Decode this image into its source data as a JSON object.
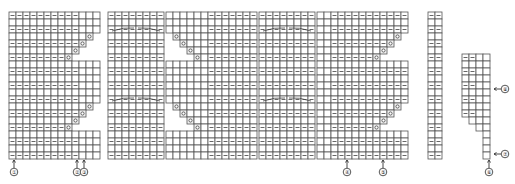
{
  "diagram": {
    "type": "knitting-chart",
    "cell_size": 7,
    "origin_y": 12,
    "colors": {
      "grid": "#555555",
      "background": "#ffffff",
      "yarn_over_box": "#f2f2f2"
    },
    "legend_symbols": {
      "blank": "knit",
      "dash": "purl",
      "circle": "yarn-over",
      "cable": "cable-cross"
    },
    "blocks": [
      {
        "id": "panel-1",
        "x": 9,
        "cols": 13,
        "rows": 21,
        "purl_cols": [
          0,
          1,
          2,
          3,
          4,
          5,
          6,
          7,
          8,
          9
        ],
        "stair": "right",
        "stair_start_row": 2,
        "stair_rows": 4
      },
      {
        "id": "panel-2",
        "x": 108,
        "cols": 8,
        "rows": 21,
        "cable": true,
        "purl_cols": [
          0,
          1,
          2,
          3,
          4,
          5,
          6,
          7
        ],
        "top_cols": [
          3,
          4
        ]
      },
      {
        "id": "panel-3",
        "x": 166,
        "cols": 13,
        "rows": 21,
        "purl_cols": [
          6,
          7,
          8,
          9,
          10,
          11,
          12
        ],
        "stair": "left",
        "stair_start_row": 2,
        "stair_rows": 4
      },
      {
        "id": "panel-4",
        "x": 259,
        "cols": 8,
        "rows": 21,
        "cable": true,
        "purl_cols": [
          0,
          1,
          2,
          3,
          4,
          5,
          6,
          7
        ],
        "top_cols": [
          3,
          4
        ]
      },
      {
        "id": "panel-5",
        "x": 317,
        "cols": 13,
        "rows": 21,
        "purl_cols": [
          2,
          3,
          4,
          5,
          6,
          7,
          8,
          9,
          10,
          11,
          12
        ],
        "stair": "right",
        "stair_start_row": 2,
        "stair_rows": 4
      },
      {
        "id": "panel-6",
        "x": 428,
        "cols": 2,
        "rows": 21,
        "purl_cols": [
          0,
          1
        ],
        "top_offset": 0
      },
      {
        "id": "panel-7",
        "x": 462,
        "cols": 4,
        "rows": 15,
        "purl_cols": [
          0,
          1
        ],
        "top_offset": 6
      }
    ],
    "markers": [
      {
        "id": "m1",
        "label": "①",
        "x": 14,
        "y": 172,
        "arrow_to_y": 160,
        "dir": "up"
      },
      {
        "id": "m2",
        "label": "②",
        "x": 77,
        "y": 172,
        "arrow_to_y": 160,
        "dir": "up"
      },
      {
        "id": "m3",
        "label": "③",
        "x": 84,
        "y": 172,
        "arrow_to_y": 160,
        "dir": "up"
      },
      {
        "id": "m4",
        "label": "④",
        "x": 347,
        "y": 172,
        "arrow_to_y": 160,
        "dir": "up"
      },
      {
        "id": "m5",
        "label": "⑤",
        "x": 383,
        "y": 172,
        "arrow_to_y": 160,
        "dir": "up"
      },
      {
        "id": "m6",
        "label": "⑥",
        "x": 489,
        "y": 172,
        "arrow_to_y": 160,
        "dir": "up"
      },
      {
        "id": "m7",
        "label": "⑦",
        "x": 505,
        "y": 154,
        "arrow_to_x": 494,
        "dir": "left"
      },
      {
        "id": "m8",
        "label": "⑧",
        "x": 505,
        "y": 89,
        "arrow_to_x": 494,
        "dir": "left"
      }
    ]
  }
}
